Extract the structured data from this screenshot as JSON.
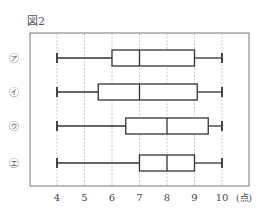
{
  "figure_label": "図2",
  "chart_data": {
    "type": "boxplot",
    "title": "図2",
    "xlabel": "(点)",
    "ylabel": "",
    "xlim": [
      3,
      11
    ],
    "xticks": [
      4,
      5,
      6,
      7,
      8,
      9,
      10
    ],
    "xtick_labels": [
      "4",
      "5",
      "6",
      "7",
      "8",
      "9",
      "10"
    ],
    "grid": "vertical dashed at integer ticks",
    "categories": [
      "㋐",
      "㋑",
      "㋒",
      "㋓"
    ],
    "series": [
      {
        "name": "㋐",
        "min": 4,
        "q1": 6,
        "median": 7,
        "q3": 9,
        "max": 10
      },
      {
        "name": "㋑",
        "min": 4,
        "q1": 5.5,
        "median": 7,
        "q3": 9.1,
        "max": 10
      },
      {
        "name": "㋒",
        "min": 4,
        "q1": 6.5,
        "median": 8,
        "q3": 9.5,
        "max": 10
      },
      {
        "name": "㋓",
        "min": 4,
        "q1": 7,
        "median": 8,
        "q3": 9,
        "max": 10
      }
    ]
  },
  "colors": {
    "line": "#333333",
    "grid": "#bbbbbb",
    "frame": "#777777"
  }
}
